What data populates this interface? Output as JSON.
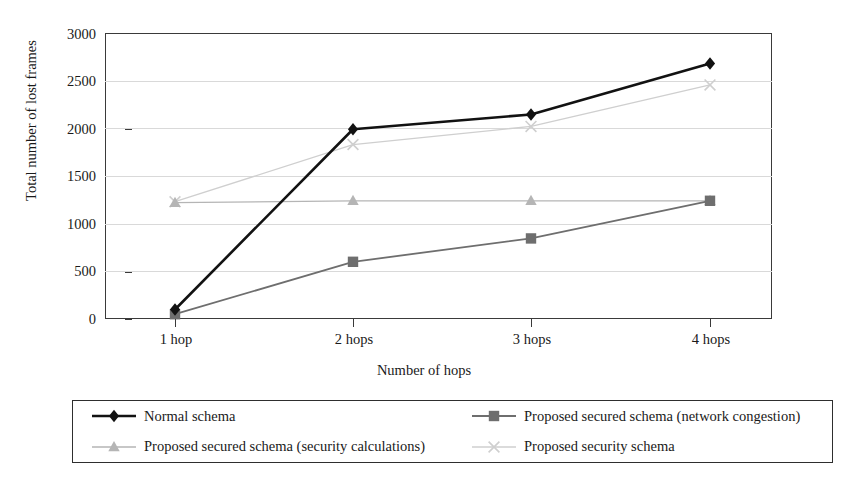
{
  "chart_data": {
    "type": "line",
    "title": "",
    "xlabel": "Number of hops",
    "ylabel": "Total number of lost frames",
    "categories": [
      "1 hop",
      "2 hops",
      "3 hops",
      "4 hops"
    ],
    "ylim": [
      0,
      3000
    ],
    "yticks": [
      0,
      500,
      1000,
      1500,
      2000,
      2500,
      3000
    ],
    "ytick_labels": [
      "0",
      "500",
      "1000",
      "1500",
      "2000",
      "2500",
      "3000"
    ],
    "grid": true,
    "legend_position": "bottom",
    "series": [
      {
        "name": "Normal schema",
        "marker": "diamond",
        "color": "#121212",
        "line_width": 2.6,
        "values": [
          100,
          1990,
          2145,
          2680
        ]
      },
      {
        "name": "Proposed secured schema (network congestion)",
        "marker": "square",
        "color": "#6e6e6e",
        "line_width": 1.8,
        "values": [
          50,
          600,
          845,
          1240
        ]
      },
      {
        "name": "Proposed secured schema (security calculations)",
        "marker": "triangle",
        "color": "#b5b5b5",
        "line_width": 1.3,
        "values": [
          1220,
          1240,
          1240,
          1240
        ]
      },
      {
        "name": "Proposed security schema",
        "marker": "cross",
        "color": "#cfcfcf",
        "line_width": 1.3,
        "values": [
          1230,
          1830,
          2020,
          2455
        ]
      }
    ]
  },
  "axis": {
    "y_title": "Total number of lost frames",
    "x_title": "Number of hops"
  },
  "legend": {
    "entries": [
      {
        "label": "Normal schema",
        "marker": "diamond",
        "color": "#121212"
      },
      {
        "label": "Proposed secured schema (network congestion)",
        "marker": "square",
        "color": "#6e6e6e"
      },
      {
        "label": "Proposed secured schema (security calculations)",
        "marker": "triangle",
        "color": "#b5b5b5"
      },
      {
        "label": "Proposed security schema",
        "marker": "cross",
        "color": "#cfcfcf"
      }
    ]
  }
}
